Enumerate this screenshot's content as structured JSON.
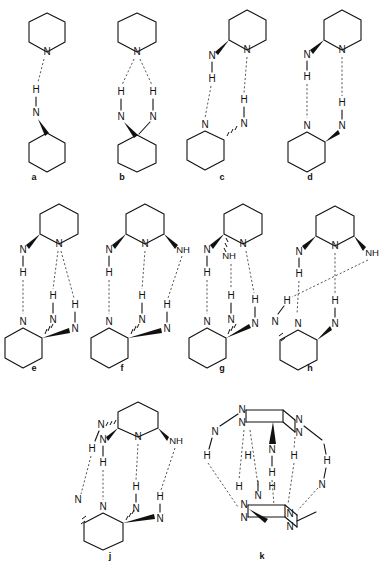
{
  "figure": {
    "background": "#ffffff",
    "line_color": "#111111",
    "hbond_color": "#3a3a3a",
    "atom_labels": {
      "nitrogen": "N",
      "hydrogen": "H",
      "amine": "NH"
    }
  },
  "panels": [
    {
      "id": "a",
      "caption": "a",
      "caption_x": 34,
      "caption_y": 178,
      "description": "piperidine N donating to a single N-H of an aminocyclohexane",
      "atoms": [
        "N",
        "H",
        "N"
      ],
      "hbond_count": 1
    },
    {
      "id": "b",
      "caption": "b",
      "caption_x": 122,
      "caption_y": 178,
      "description": "piperidine N accepting two N-H groups of a geminal diaminocyclohexane",
      "atoms": [
        "N",
        "H",
        "H",
        "N",
        "N"
      ],
      "hbond_count": 2
    },
    {
      "id": "c",
      "caption": "c",
      "caption_x": 222,
      "caption_y": 178,
      "description": "antiparallel dimer of 2-aminopiperidine with two N-H...N bridges",
      "atoms": [
        "N",
        "N",
        "H",
        "H",
        "N",
        "N"
      ],
      "hbond_count": 2
    },
    {
      "id": "d",
      "caption": "d",
      "caption_x": 310,
      "caption_y": 178,
      "description": "parallel dimer of 2-aminopiperidine with two vertical N-H...N bridges",
      "atoms": [
        "N",
        "N",
        "H",
        "H",
        "N",
        "N"
      ],
      "hbond_count": 2
    },
    {
      "id": "e",
      "caption": "e",
      "caption_x": 34,
      "caption_y": 369,
      "description": "2,6-diaminopiperidine dimer, three hydrogen bonds, one bifurcated acceptor",
      "atoms": [
        "N",
        "N",
        "H",
        "H",
        "H",
        "N",
        "N",
        "N"
      ],
      "hbond_count": 3
    },
    {
      "id": "f",
      "caption": "f",
      "caption_x": 122,
      "caption_y": 369,
      "description": "2,6-diaminopiperidine dimer with NH group on the right, three hydrogen bonds",
      "atoms": [
        "N",
        "N",
        "NH",
        "H",
        "H",
        "H",
        "N",
        "N",
        "N"
      ],
      "hbond_count": 3
    },
    {
      "id": "g",
      "caption": "g",
      "caption_x": 222,
      "caption_y": 369,
      "description": "2,6-diaminopiperidine dimer with central NH, three parallel hydrogen bonds",
      "atoms": [
        "N",
        "NH",
        "N",
        "H",
        "H",
        "H",
        "N",
        "N",
        "N"
      ],
      "hbond_count": 3
    },
    {
      "id": "h",
      "caption": "h",
      "caption_x": 310,
      "caption_y": 369,
      "description": "2,6-diaminopiperidine dimer with one long crossing hydrogen bond",
      "atoms": [
        "N",
        "N",
        "NH",
        "H",
        "H",
        "H",
        "N",
        "N",
        "N"
      ],
      "hbond_count": 4
    },
    {
      "id": "j",
      "caption": "j",
      "caption_x": 110,
      "caption_y": 557,
      "description": "2,6-diaminopiperidine dimer drawn in perspective with four hydrogen bonds",
      "atoms": [
        "N",
        "N",
        "NH",
        "N",
        "H",
        "H",
        "H",
        "H",
        "N",
        "N",
        "N"
      ],
      "hbond_count": 4
    },
    {
      "id": "k",
      "caption": "k",
      "caption_x": 262,
      "caption_y": 557,
      "description": "cage-like hydrogen bonded assembly of two triaminopiperidine units",
      "atoms": [
        "N",
        "N",
        "N",
        "N",
        "N",
        "H",
        "H",
        "H",
        "H",
        "H",
        "H",
        "N",
        "N",
        "N",
        "N",
        "N"
      ],
      "hbond_count": 6
    }
  ]
}
